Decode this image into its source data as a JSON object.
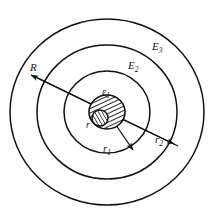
{
  "figure": {
    "type": "diagram",
    "background_color": "#ffffff",
    "stroke_color": "#111111",
    "center": {
      "x": 107,
      "y": 112
    },
    "circles": [
      {
        "name": "outer-boundary",
        "rx": 97,
        "ry": 93,
        "label": "E_3"
      },
      {
        "name": "middle-boundary",
        "rx": 70,
        "ry": 67,
        "label": "E_2"
      },
      {
        "name": "inner-boundary",
        "rx": 43,
        "ry": 41,
        "label": "E_1"
      },
      {
        "name": "hatched-core",
        "rx": 18,
        "ry": 17,
        "label": "r"
      },
      {
        "name": "hatched-inner-core",
        "rx": 8,
        "ry": 8,
        "label": ""
      }
    ],
    "labels": {
      "region_outer": "E",
      "region_outer_sub": "3",
      "region_middle": "E",
      "region_middle_sub": "2",
      "region_core": "ε",
      "region_core_sub": "1",
      "radius_outer": "R",
      "radius_core": "r",
      "radius_inner": "r",
      "radius_inner_sub": "1",
      "radius_middle": "r",
      "radius_middle_sub": "2"
    },
    "arrows": [
      {
        "name": "arrow-R",
        "from": "center",
        "to": "outer-boundary-upper-left",
        "label": "R"
      },
      {
        "name": "arrow-r2",
        "from": "center",
        "to": "middle-boundary-lower-right",
        "label": "r2"
      },
      {
        "name": "arrow-r1",
        "from": "center",
        "to": "inner-boundary-lower-right",
        "label": "r1"
      }
    ]
  }
}
